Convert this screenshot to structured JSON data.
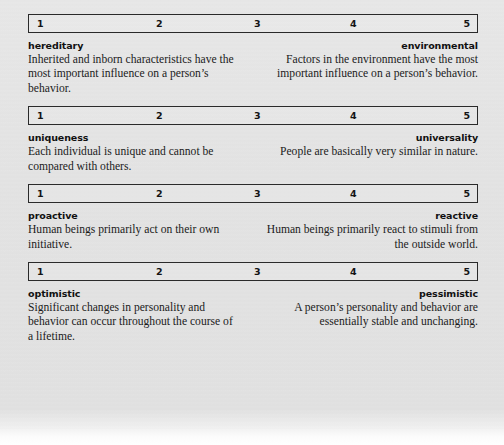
{
  "scale": {
    "ticks": [
      "1",
      "2",
      "3",
      "4",
      "5"
    ]
  },
  "dimensions": [
    {
      "id": "hereditary-environmental",
      "left": {
        "label": "hereditary",
        "description": "Inherited and inborn characteristics have the most important influence on a person’s behavior."
      },
      "right": {
        "label": "environmental",
        "description": "Factors in the environment have the most important influence on a person’s behavior."
      }
    },
    {
      "id": "uniqueness-universality",
      "left": {
        "label": "uniqueness",
        "description": "Each individual is unique and cannot be compared with others."
      },
      "right": {
        "label": "universality",
        "description": "People are basically very similar in nature."
      }
    },
    {
      "id": "proactive-reactive",
      "left": {
        "label": "proactive",
        "description": "Human beings primarily act on their own initiative."
      },
      "right": {
        "label": "reactive",
        "description": "Human beings primarily react to stimuli from the outside world."
      }
    },
    {
      "id": "optimistic-pessimistic",
      "left": {
        "label": "optimistic",
        "description": "Significant changes in personality and behavior can occur throughout the course of a lifetime."
      },
      "right": {
        "label": "pessimistic",
        "description": "A person’s personality and behavior are essentially stable and unchanging."
      }
    }
  ],
  "colors": {
    "page_background": "#e5e5e5",
    "border": "#2a2a2a",
    "text": "#1b1b1b"
  }
}
